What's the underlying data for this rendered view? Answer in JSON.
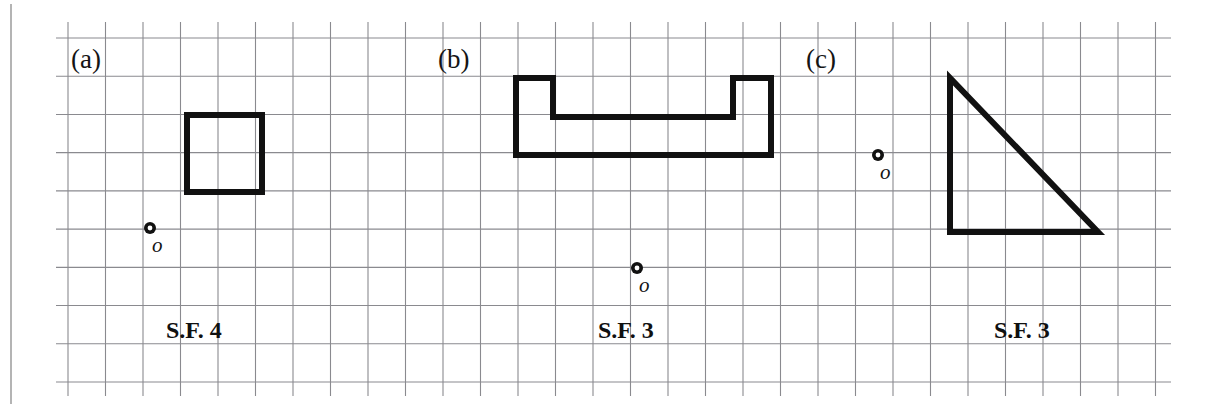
{
  "figure": {
    "width": 1213,
    "height": 410,
    "background_color": "#ffffff",
    "border_color": "#b4b4b4",
    "grid": {
      "line_color": "#8a8a8f",
      "spacing_px": 37.5,
      "x_start": 68,
      "x_end": 1163,
      "y_start": 38,
      "y_end": 382,
      "columns": 29,
      "rows": 9
    },
    "shape_stroke_color": "#111111",
    "shape_stroke_width": 6
  },
  "panels": [
    {
      "id": "a",
      "label": "(a)",
      "label_x": 71,
      "label_y": 46,
      "scale_factor_label": "S.F. 4",
      "scale_factor_value": 4,
      "sf_x": 166,
      "sf_y": 318,
      "origin": {
        "label": "o",
        "cx": 150,
        "cy": 228,
        "outer_r": 6,
        "inner_r": 2.4,
        "label_x": 152,
        "label_y": 235
      },
      "shape": {
        "name": "square",
        "type": "polygon",
        "closed": true,
        "points": [
          [
            187,
            115
          ],
          [
            262,
            115
          ],
          [
            262,
            192
          ],
          [
            187,
            192
          ]
        ]
      }
    },
    {
      "id": "b",
      "label": "(b)",
      "label_x": 438,
      "label_y": 46,
      "scale_factor_label": "S.F. 3",
      "scale_factor_value": 3,
      "sf_x": 598,
      "sf_y": 318,
      "origin": {
        "label": "o",
        "cx": 637,
        "cy": 268,
        "outer_r": 6,
        "inner_r": 2.4,
        "label_x": 639,
        "label_y": 275
      },
      "shape": {
        "name": "u-shape",
        "type": "polygon",
        "closed": true,
        "points": [
          [
            516,
            78
          ],
          [
            553,
            78
          ],
          [
            553,
            117
          ],
          [
            733,
            117
          ],
          [
            733,
            78
          ],
          [
            771,
            78
          ],
          [
            771,
            155
          ],
          [
            516,
            155
          ]
        ]
      }
    },
    {
      "id": "c",
      "label": "(c)",
      "label_x": 806,
      "label_y": 46,
      "scale_factor_label": "S.F. 3",
      "scale_factor_value": 3,
      "sf_x": 994,
      "sf_y": 318,
      "origin": {
        "label": "o",
        "cx": 878,
        "cy": 155,
        "outer_r": 6,
        "inner_r": 2.4,
        "label_x": 880,
        "label_y": 162
      },
      "shape": {
        "name": "right-triangle",
        "type": "polygon",
        "closed": true,
        "points": [
          [
            950,
            78
          ],
          [
            950,
            232
          ],
          [
            1098,
            232
          ]
        ]
      }
    }
  ]
}
